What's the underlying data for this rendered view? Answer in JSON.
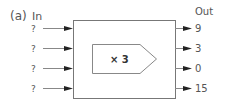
{
  "figure": {
    "label": "(a)",
    "in_header": "In",
    "out_header": "Out",
    "machine_label": "× 3",
    "inputs": [
      "?",
      "?",
      "?",
      "?"
    ],
    "outputs": [
      "9",
      "3",
      "0",
      "15"
    ]
  },
  "colors": {
    "line": "#888888",
    "arrowhead": "#222222",
    "text": "#555555",
    "box_border": "#777777"
  }
}
